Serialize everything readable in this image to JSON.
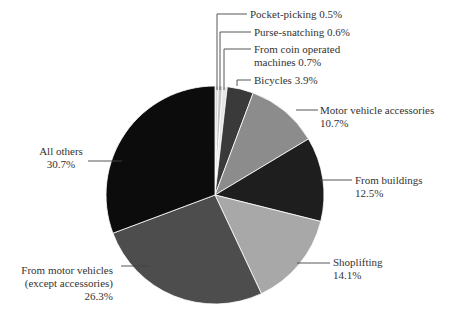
{
  "chart_data": {
    "type": "pie",
    "title": "",
    "start": "12 o'clock",
    "direction": "clockwise",
    "slices": [
      {
        "label": "Pocket-picking",
        "value": 0.5,
        "display": "Pocket-picking 0.5%",
        "color": "#d9d9d9"
      },
      {
        "label": "Purse-snatching",
        "value": 0.6,
        "display": "Purse-snatching 0.6%",
        "color": "#c4c4c4"
      },
      {
        "label": "From coin operated machines",
        "value": 0.7,
        "display_lines": [
          "From coin operated",
          "machines 0.7%"
        ],
        "color": "#e6e6e6"
      },
      {
        "label": "Bicycles",
        "value": 3.9,
        "display": "Bicycles 3.9%",
        "color": "#3a3a3a"
      },
      {
        "label": "Motor vehicle accessories",
        "value": 10.7,
        "display_lines": [
          "Motor vehicle accessories",
          "10.7%"
        ],
        "color": "#8c8c8c"
      },
      {
        "label": "From buildings",
        "value": 12.5,
        "display_lines": [
          "From buildings",
          "12.5%"
        ],
        "color": "#1e1e1e"
      },
      {
        "label": "Shoplifting",
        "value": 14.1,
        "display_lines": [
          "Shoplifting",
          "14.1%"
        ],
        "color": "#a8a8a8"
      },
      {
        "label": "From motor vehicles (except accessories)",
        "value": 26.3,
        "display_lines": [
          "From motor vehicles",
          "(except accessories)",
          "26.3%"
        ],
        "color": "#4d4d4d"
      },
      {
        "label": "All others",
        "value": 30.7,
        "display_lines": [
          "All others",
          "30.7%"
        ],
        "color": "#0c0c0c"
      }
    ]
  }
}
